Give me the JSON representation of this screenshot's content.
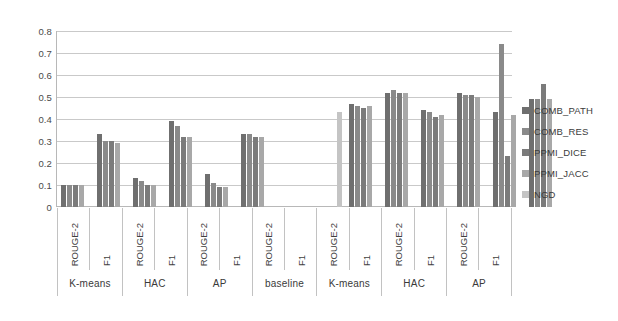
{
  "chart_data": {
    "type": "bar",
    "title": "",
    "xlabel": "",
    "ylabel": "",
    "ylim": [
      0,
      0.8
    ],
    "ytick_labels": [
      "0.8",
      "0.7",
      "0.6",
      "0.5",
      "0.4",
      "0.3",
      "0.2",
      "0.1",
      "0"
    ],
    "ytick_values": [
      0.8,
      0.7,
      0.6,
      0.5,
      0.4,
      0.3,
      0.2,
      0.1,
      0
    ],
    "grid": true,
    "legend_position": "right",
    "legend": [
      "COMB_PATH",
      "COMB_RES",
      "PPMI_DICE",
      "PPMI_JACC",
      "NGD"
    ],
    "series_colors": [
      "#6f6f6f",
      "#8a8a8a",
      "#7b7b7b",
      "#a8a8a8",
      "#c4c4c4"
    ],
    "categories": [
      "ROUGE-2",
      "F1",
      "ROUGE-2",
      "F1",
      "ROUGE-2",
      "F1",
      "ROUGE-2",
      "F1",
      "ROUGE-2",
      "F1",
      "ROUGE-2",
      "F1",
      "ROUGE-2",
      "F1"
    ],
    "supergroups": [
      {
        "label": "K-means",
        "span": 2
      },
      {
        "label": "HAC",
        "span": 2
      },
      {
        "label": "AP",
        "span": 2
      },
      {
        "label": "baseline",
        "span": 2
      },
      {
        "label": "K-means",
        "span": 2
      },
      {
        "label": "HAC",
        "span": 2
      },
      {
        "label": "AP",
        "span": 2
      }
    ],
    "series": [
      {
        "name": "COMB_PATH",
        "values": [
          0.1,
          0.33,
          0.13,
          0.39,
          0.15,
          0.33,
          0.0,
          0.0,
          0.47,
          0.52,
          0.44,
          0.52,
          0.43,
          0.49
        ]
      },
      {
        "name": "COMB_RES",
        "values": [
          0.1,
          0.3,
          0.12,
          0.37,
          0.11,
          0.33,
          0.0,
          0.0,
          0.46,
          0.53,
          0.43,
          0.51,
          0.74,
          0.49
        ]
      },
      {
        "name": "PPMI_DICE",
        "values": [
          0.1,
          0.3,
          0.1,
          0.32,
          0.09,
          0.32,
          0.0,
          0.0,
          0.45,
          0.52,
          0.41,
          0.51,
          0.23,
          0.56
        ]
      },
      {
        "name": "PPMI_JACC",
        "values": [
          0.1,
          0.29,
          0.1,
          0.32,
          0.09,
          0.32,
          0.0,
          0.0,
          0.46,
          0.52,
          0.42,
          0.5,
          0.42,
          0.49
        ]
      },
      {
        "name": "NGD",
        "values": [
          0.0,
          0.0,
          0.0,
          0.0,
          0.0,
          0.0,
          0.0,
          0.43,
          0.0,
          0.0,
          0.0,
          0.0,
          0.0,
          0.0
        ]
      }
    ]
  }
}
